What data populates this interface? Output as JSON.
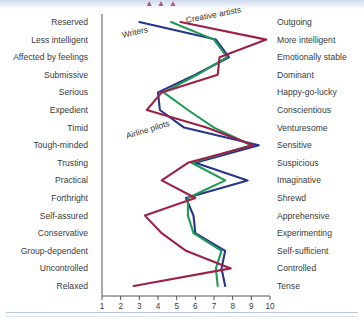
{
  "page": {
    "top_banner_fragment": "▲▲▲",
    "background_color": "#ffffff"
  },
  "chart_data": {
    "type": "line",
    "orientation": "horizontal-profile",
    "title": "",
    "subtitle": "",
    "xlabel": "",
    "ylabel": "",
    "xlim": [
      1,
      10
    ],
    "grid": false,
    "legend": "inline-annotations",
    "x_ticks": [
      "1",
      "2",
      "3",
      "4",
      "5",
      "6",
      "7",
      "8",
      "9",
      "10"
    ],
    "categories_left": [
      "Reserved",
      "Less intelligent",
      "Affected by feelings",
      "Submissive",
      "Serious",
      "Expedient",
      "Timid",
      "Tough-minded",
      "Trusting",
      "Practical",
      "Forthright",
      "Self-assured",
      "Conservative",
      "Group-dependent",
      "Uncontrolled",
      "Relaxed"
    ],
    "categories_right": [
      "Outgoing",
      "More intelligent",
      "Emotionally stable",
      "Dominant",
      "Happy-go-lucky",
      "Conscientious",
      "Venturesome",
      "Sensitive",
      "Suspicious",
      "Imaginative",
      "Shrewd",
      "Apprehensive",
      "Experimenting",
      "Self-sufficient",
      "Controlled",
      "Tense"
    ],
    "series": [
      {
        "name": "Writers",
        "color": "#27348b",
        "values": [
          3.0,
          7.1,
          7.8,
          6.0,
          4.0,
          4.1,
          5.4,
          9.4,
          6.0,
          8.8,
          5.5,
          5.9,
          6.0,
          7.6,
          7.4,
          7.6
        ]
      },
      {
        "name": "Airline pilots",
        "color": "#1f9b55",
        "values": [
          4.7,
          7.0,
          7.7,
          6.1,
          4.3,
          5.6,
          7.0,
          9.0,
          5.8,
          7.6,
          5.6,
          5.6,
          5.9,
          7.4,
          7.1,
          7.2
        ]
      },
      {
        "name": "Creative artists",
        "color": "#9b2148",
        "values": [
          5.2,
          9.8,
          7.3,
          7.2,
          4.2,
          3.4,
          6.6,
          9.1,
          5.6,
          4.2,
          6.0,
          3.3,
          4.2,
          5.5,
          7.9,
          2.7
        ]
      }
    ],
    "annotations": [
      {
        "text": "Writers",
        "series": "Writers"
      },
      {
        "text": "Airline pilots",
        "series": "Airline pilots"
      },
      {
        "text": "Creative artists",
        "series": "Creative artists"
      }
    ]
  }
}
